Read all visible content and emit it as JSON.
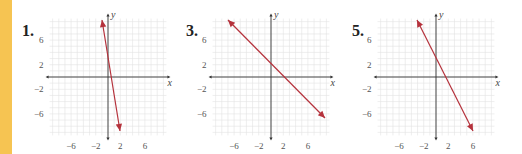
{
  "colors": {
    "sidebar": "#f6c452",
    "line": "#b5323c",
    "axis": "#333333",
    "grid": "#e2e2e2"
  },
  "chart_data": [
    {
      "type": "line",
      "title": "1.",
      "xlabel": "x",
      "ylabel": "y",
      "xlim": [
        -9.5,
        9.5
      ],
      "ylim": [
        -9.5,
        9.5
      ],
      "x_ticks": [
        -6,
        -2,
        2,
        6
      ],
      "y_ticks": [
        6,
        2,
        -2,
        -6
      ],
      "grid": true,
      "series": [
        {
          "name": "line 1",
          "x": [
            -1,
            2
          ],
          "y": [
            9.3,
            -8.8
          ]
        }
      ],
      "origin_px": [
        108,
        77
      ],
      "unit_px": 6.15,
      "endpoints_px": [
        [
          102,
          20
        ],
        [
          120,
          131
        ]
      ],
      "label_px": [
        22,
        38
      ]
    },
    {
      "type": "line",
      "title": "3.",
      "xlabel": "x",
      "ylabel": "y",
      "xlim": [
        -9.5,
        9.5
      ],
      "ylim": [
        -9.5,
        9.5
      ],
      "x_ticks": [
        -6,
        -2,
        2,
        6
      ],
      "y_ticks": [
        6,
        2,
        -2,
        -6
      ],
      "grid": true,
      "series": [
        {
          "name": "line 3",
          "x": [
            -7,
            8.8
          ],
          "y": [
            9.3,
            -6.7
          ]
        }
      ],
      "origin_px": [
        271,
        77
      ],
      "unit_px": 6.15,
      "endpoints_px": [
        [
          228,
          20
        ],
        [
          325,
          118
        ]
      ],
      "label_px": [
        186,
        38
      ]
    },
    {
      "type": "line",
      "title": "5.",
      "xlabel": "x",
      "ylabel": "y",
      "xlim": [
        -9.5,
        9.5
      ],
      "ylim": [
        -9.5,
        9.5
      ],
      "x_ticks": [
        -6,
        -2,
        2,
        6
      ],
      "y_ticks": [
        6,
        2,
        -2,
        -6
      ],
      "grid": true,
      "series": [
        {
          "name": "line 5",
          "x": [
            -3.1,
            6
          ],
          "y": [
            9.3,
            -8.8
          ]
        }
      ],
      "origin_px": [
        436,
        77
      ],
      "unit_px": 6.15,
      "endpoints_px": [
        [
          417,
          20
        ],
        [
          473,
          131
        ]
      ],
      "label_px": [
        352,
        38
      ]
    }
  ]
}
